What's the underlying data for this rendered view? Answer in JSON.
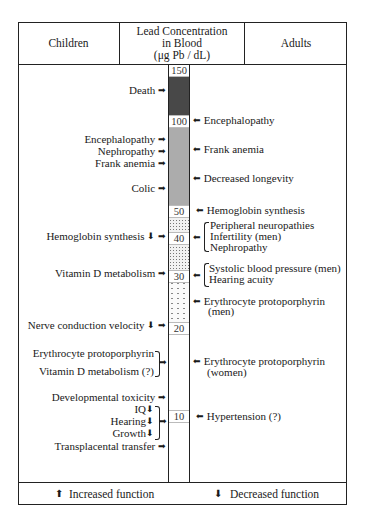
{
  "header": {
    "children": "Children",
    "center_line1": "Lead Concentration",
    "center_line2": "in Blood",
    "center_line3": "(μg Pb / dL)",
    "adults": "Adults"
  },
  "scale": {
    "ticks": [
      "150",
      "100",
      "50",
      "40",
      "30",
      "20",
      "10"
    ]
  },
  "children_effects": [
    {
      "label": "Death",
      "marker": "➡"
    },
    {
      "label": "Encephalopathy",
      "marker": "➡"
    },
    {
      "label": "Nephropathy",
      "marker": "➡"
    },
    {
      "label": "Frank anemia",
      "marker": "➡"
    },
    {
      "label": "Colic",
      "marker": "➡"
    },
    {
      "label": "Hemoglobin synthesis",
      "direction": "⬇",
      "marker": "➡"
    },
    {
      "label": "Vitamin D metabolism",
      "marker": "➡"
    },
    {
      "label": "Nerve conduction velocity",
      "direction": "⬇",
      "marker": "➡"
    },
    {
      "label": "Erythrocyte protoporphyrin"
    },
    {
      "label": "Vitamin D metabolism (?)",
      "marker": "➡"
    },
    {
      "label": "Developmental toxicity",
      "marker": "➡"
    },
    {
      "label": "IQ",
      "direction": "⬇"
    },
    {
      "label": "Hearing",
      "direction": "⬇",
      "marker": "➡"
    },
    {
      "label": "Growth",
      "direction": "⬇"
    },
    {
      "label": "Transplacental transfer",
      "marker": "➡"
    }
  ],
  "adult_effects": [
    {
      "label": "Encephalopathy",
      "marker": "⬅"
    },
    {
      "label": "Frank anemia",
      "marker": "⬅"
    },
    {
      "label": "Decreased longevity",
      "marker": "⬅"
    },
    {
      "label": "Hemoglobin synthesis",
      "marker": "⬅"
    },
    {
      "label": "Peripheral neuropathies",
      "marker": "⬅"
    },
    {
      "label": "Infertility (men)"
    },
    {
      "label": "Nephropathy"
    },
    {
      "label": "Systolic blood pressure (men)",
      "marker": "⬅"
    },
    {
      "label": "Hearing acuity"
    },
    {
      "label": "Erythrocyte protoporphyrin",
      "marker": "⬅"
    },
    {
      "label": "(men)"
    },
    {
      "label": "Erythrocyte protoporphyrin",
      "marker": "⬅"
    },
    {
      "label": "(women)"
    },
    {
      "label": "Hypertension (?)",
      "marker": "⬅"
    }
  ],
  "legend": {
    "increased_icon": "⬆",
    "increased": "Increased function",
    "decreased_icon": "⬇",
    "decreased": "Decreased function"
  }
}
